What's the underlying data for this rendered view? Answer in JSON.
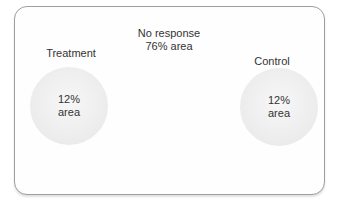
{
  "no_response": {
    "line1": "No response",
    "line2": "76% area"
  },
  "groups": {
    "treatment": {
      "label": "Treatment",
      "area_line1": "12%",
      "area_line2": "area"
    },
    "control": {
      "label": "Control",
      "area_line1": "12%",
      "area_line2": "area"
    }
  },
  "colors": {
    "frame_border": "#9e9e9e",
    "circle_fill": "#ececec",
    "text": "#333333",
    "background": "#ffffff"
  }
}
